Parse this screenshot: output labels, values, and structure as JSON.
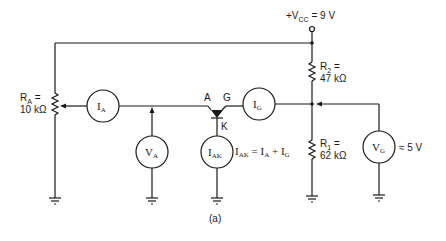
{
  "figure": {
    "caption": "(a)",
    "supply": {
      "prefix": "+V",
      "sub": "CC",
      "suffix": " = 9 V"
    },
    "resistors": {
      "ra": {
        "name": "R",
        "sub": "A",
        "eq": " =",
        "value": "10 kΩ"
      },
      "r2": {
        "name": "R",
        "sub": "2",
        "eq": " =",
        "value": "47 kΩ"
      },
      "r1": {
        "name": "R",
        "sub": "1",
        "eq": " =",
        "value": "62 kΩ"
      }
    },
    "meters": {
      "ia": {
        "main": "I",
        "sub": "A"
      },
      "va": {
        "main": "V",
        "sub": "A"
      },
      "iak": {
        "main": "I",
        "sub": "AK"
      },
      "ig": {
        "main": "I",
        "sub": "G"
      },
      "vg": {
        "main": "V",
        "sub": "G"
      }
    },
    "scr_terminals": {
      "anode": "A",
      "gate": "G",
      "cathode": "K"
    },
    "equation": {
      "lhs": "I",
      "lhs_sub": "AK",
      "mid": " = I",
      "a_sub": "A",
      "plus": " + I",
      "g_sub": "G"
    },
    "vg_value": "≈ 5 V"
  }
}
